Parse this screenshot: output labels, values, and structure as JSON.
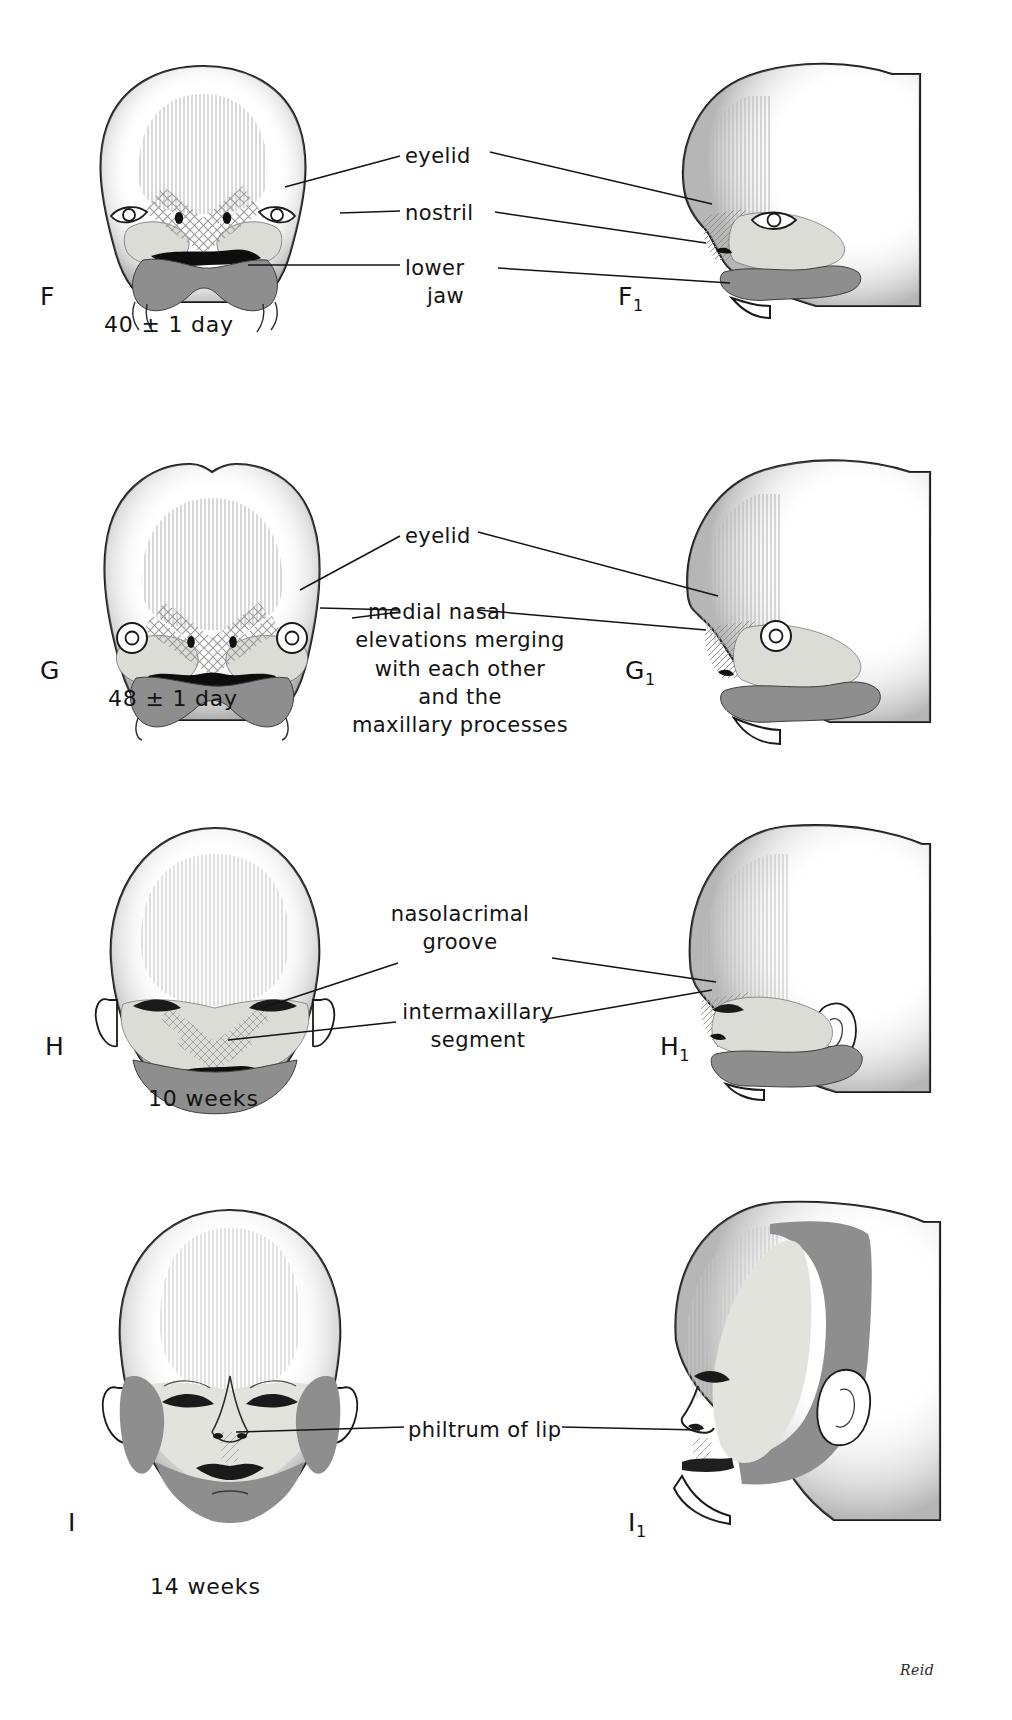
{
  "plate": {
    "title": "Development of the human face",
    "signature": "Reid",
    "colors": {
      "ink": "#131313",
      "outline": "#1a1a1a",
      "light_shade": "#dcdcd6",
      "mid_shade": "#8e8e8e",
      "dark_shade": "#7f7f7f",
      "background": "#ffffff"
    }
  },
  "panels": [
    {
      "id": "F",
      "front_letter": "F",
      "profile_letter": "F",
      "profile_sub": "1",
      "caption": "40 ± 1 day",
      "labels": [
        {
          "text": "eyelid",
          "lines": 1
        },
        {
          "text": "nostril",
          "lines": 1
        },
        {
          "text": "lower",
          "text2": "jaw",
          "lines": 2
        }
      ]
    },
    {
      "id": "G",
      "front_letter": "G",
      "profile_letter": "G",
      "profile_sub": "1",
      "caption": "48 ± 1 day",
      "labels": [
        {
          "text": "eyelid",
          "lines": 1
        },
        {
          "text": "medial  nasal",
          "text2": "elevations  merging",
          "text3": "with each other",
          "text4": "and the",
          "text5": "maxillary  processes",
          "lines": 5
        }
      ]
    },
    {
      "id": "H",
      "front_letter": "H",
      "profile_letter": "H",
      "profile_sub": "1",
      "caption": "10 weeks",
      "labels": [
        {
          "text": "nasolacrimal",
          "text2": "groove",
          "lines": 2
        },
        {
          "text": "intermaxillary",
          "text2": "segment",
          "lines": 2
        }
      ]
    },
    {
      "id": "I",
      "front_letter": "I",
      "profile_letter": "I",
      "profile_sub": "1",
      "caption": "14 weeks",
      "labels": [
        {
          "text": "philtrum of lip",
          "lines": 1
        }
      ]
    }
  ]
}
